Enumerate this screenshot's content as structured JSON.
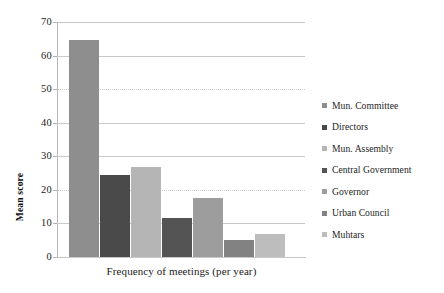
{
  "chart_data": {
    "type": "bar",
    "title": "",
    "xlabel": "Frequency of meetings (per year)",
    "ylabel": "Mean score",
    "categories": [
      "Mun. Committee",
      "Directors",
      "Mun. Assembly",
      "Central Government",
      "Governor",
      "Urban Council",
      "Muhtars"
    ],
    "values": [
      64.5,
      24.5,
      26.8,
      11.5,
      17.5,
      5.0,
      6.8
    ],
    "colors": [
      "#8e8e8e",
      "#4a4a4a",
      "#b5b5b5",
      "#545454",
      "#9d9d9d",
      "#828282",
      "#bdbdbd"
    ],
    "ylim": [
      0,
      70
    ],
    "yticks": [
      0,
      10,
      20,
      30,
      40,
      50,
      60,
      70
    ],
    "ytick_labels": [
      "0",
      "10",
      "20",
      "30",
      "40",
      "50",
      "60",
      "70"
    ],
    "grid": true,
    "legend_position": "right",
    "series_name": "Mean score"
  },
  "legend": {
    "items": [
      {
        "label": "Mun. Committee",
        "color": "#8e8e8e"
      },
      {
        "label": "Directors",
        "color": "#4a4a4a"
      },
      {
        "label": "Mun. Assembly",
        "color": "#b5b5b5"
      },
      {
        "label": "Central Government",
        "color": "#545454"
      },
      {
        "label": "Governor",
        "color": "#9d9d9d"
      },
      {
        "label": "Urban Council",
        "color": "#828282"
      },
      {
        "label": "Muhtars",
        "color": "#bdbdbd"
      }
    ]
  },
  "axes": {
    "y_title": "Mean score",
    "x_title": "Frequency of meetings (per year)"
  }
}
